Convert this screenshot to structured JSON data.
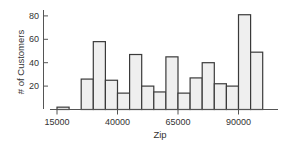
{
  "chart_data": {
    "type": "bar",
    "subtype": "histogram",
    "title": "",
    "xlabel": "Zip",
    "ylabel": "# of Customers",
    "bin_width": 5000,
    "bin_starts": [
      15000,
      20000,
      25000,
      30000,
      35000,
      40000,
      45000,
      50000,
      55000,
      60000,
      65000,
      70000,
      75000,
      80000,
      85000,
      90000,
      95000
    ],
    "values": [
      2,
      0,
      26,
      58,
      25,
      14,
      47,
      20,
      15,
      45,
      14,
      27,
      40,
      22,
      20,
      81,
      49
    ],
    "x_ticks": [
      15000,
      40000,
      65000,
      90000
    ],
    "x_tick_labels": [
      "15000",
      "40000",
      "65000",
      "90000"
    ],
    "y_ticks": [
      20,
      40,
      60,
      80
    ],
    "y_tick_labels": [
      "20",
      "40",
      "60",
      "80"
    ],
    "xlim": [
      15000,
      105000
    ],
    "ylim": [
      0,
      85
    ],
    "grid": false,
    "legend": null,
    "colors": {
      "bar_fill": "#efefef",
      "bar_stroke": "#3a3a3a",
      "axis": "#555555"
    }
  }
}
